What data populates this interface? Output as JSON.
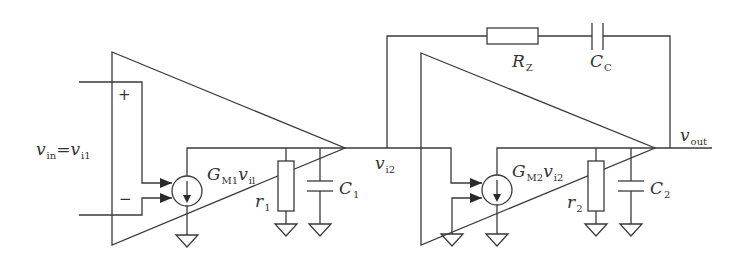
{
  "diagram": {
    "type": "circuit-schematic",
    "stage1": {
      "input_label": {
        "main": "v",
        "sub1": "in",
        "eq": "=",
        "main2": "v",
        "sub2": "i1"
      },
      "plus_sign": "+",
      "minus_sign": "−",
      "gm_label": {
        "main": "G",
        "sub": "M1",
        "var": "v",
        "var_sub": "il"
      },
      "r_label": {
        "main": "r",
        "sub": "1"
      },
      "c_label": {
        "main": "C",
        "sub": "1"
      }
    },
    "node_between": {
      "main": "v",
      "sub": "i2"
    },
    "stage2": {
      "gm_label": {
        "main": "G",
        "sub": "M2",
        "var": "v",
        "var_sub": "i2"
      },
      "r_label": {
        "main": "r",
        "sub": "2"
      },
      "c_label": {
        "main": "C",
        "sub": "2"
      }
    },
    "compensation": {
      "rz_label": {
        "main": "R",
        "sub": "Z"
      },
      "cc_label": {
        "main": "C",
        "sub": "C"
      }
    },
    "output_label": {
      "main": "v",
      "sub": "out"
    },
    "colors": {
      "wire": "#3a3a3a",
      "background": "#ffffff",
      "text": "#333333"
    }
  }
}
